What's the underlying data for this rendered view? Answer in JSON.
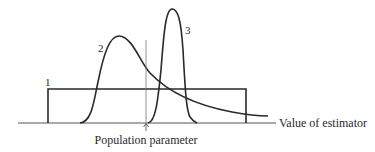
{
  "diagram": {
    "curves": [
      {
        "id": "1",
        "label": "1",
        "shape": "uniform (rectangle)"
      },
      {
        "id": "2",
        "label": "2",
        "shape": "right-skewed, biased"
      },
      {
        "id": "3",
        "label": "3",
        "shape": "narrow, peaked"
      }
    ],
    "axis_label": "Value of estimator",
    "reference_label": "Population parameter",
    "colors": {
      "line": "#2a2a2a",
      "axis": "#555555",
      "background": "#ffffff"
    }
  }
}
